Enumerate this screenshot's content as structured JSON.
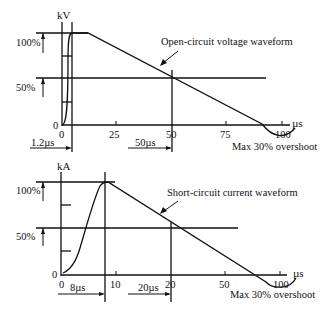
{
  "diagrams": [
    {
      "id": "voltage",
      "title": "Open-circuit voltage waveform",
      "y_unit": "kV",
      "x_unit": "µs",
      "levels": [
        "100%",
        "50%"
      ],
      "origin_label_y": "0",
      "x_ticks": [
        "0",
        "25",
        "50",
        "75",
        "100"
      ],
      "front_time": "1.2µs",
      "half_value_time": "50µs",
      "overshoot_note": "Max 30% overshoot"
    },
    {
      "id": "current",
      "title": "Short-circuit current waveform",
      "y_unit": "kA",
      "x_unit": "µs",
      "levels": [
        "100%",
        "50%"
      ],
      "origin_label_y": "0",
      "x_ticks": [
        "0",
        "10",
        "20",
        "50",
        "100"
      ],
      "front_time": "8µs",
      "half_value_time": "20µs",
      "overshoot_note": "Max 30% overshoot"
    }
  ]
}
